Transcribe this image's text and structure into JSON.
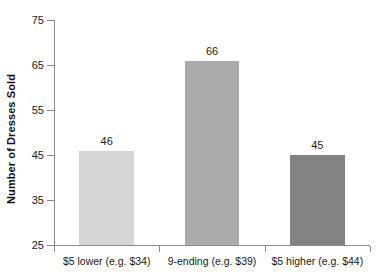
{
  "chart_data": {
    "type": "bar",
    "title": "",
    "subtitle": "",
    "xlabel": "",
    "ylabel": "Number of Dresses Sold",
    "categories": [
      "$5 lower (e.g. $34)",
      "9-ending (e.g. $39)",
      "$5 higher (e.g. $44)"
    ],
    "values": [
      46,
      66,
      45
    ],
    "value_labels": [
      "46",
      "66",
      "45"
    ],
    "bar_colors": [
      "#D6D6D6",
      "#ABABAB",
      "#828282"
    ],
    "ylim": [
      25,
      75
    ],
    "yticks": [
      25,
      35,
      45,
      55,
      65,
      75
    ],
    "ytick_labels": [
      "25",
      "35",
      "45",
      "55",
      "65",
      "75"
    ],
    "grid": false,
    "legend": false,
    "legend_position": "none",
    "axis_color": "#8C8C8C",
    "background_color": "#FFFFFF",
    "text_color": "#1A1A1A"
  }
}
